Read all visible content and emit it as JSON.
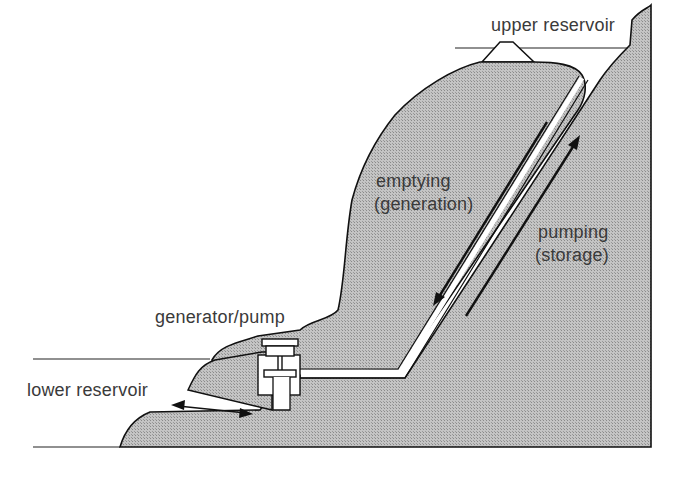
{
  "diagram": {
    "labels": {
      "upper_reservoir": "upper reservoir",
      "emptying_line1": "emptying",
      "emptying_line2": "(generation)",
      "pumping_line1": "pumping",
      "pumping_line2": "(storage)",
      "generator_pump": "generator/pump",
      "lower_reservoir": "lower reservoir"
    },
    "colors": {
      "ground_fill": "#b8b8b8",
      "outline": "#111111",
      "text": "#3a3a3a",
      "background": "#ffffff"
    },
    "arrows": {
      "emptying_direction": "down",
      "pumping_direction": "up",
      "lower_reservoir": "bidirectional"
    }
  }
}
